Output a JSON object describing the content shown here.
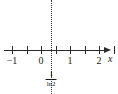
{
  "chart_data": {
    "type": "line",
    "title": "",
    "subtitle": "",
    "xlabel": "x",
    "ylabel": "",
    "xlim": [
      -1.55,
      2.65
    ],
    "ylim": [
      -1,
      1
    ],
    "grid": false,
    "legend": null,
    "axis": {
      "name": "x",
      "arrow": "right",
      "tick_interval": 0.5,
      "minor_ticks": [
        -1.5,
        -1,
        -0.5,
        0,
        0.5,
        1,
        1.5,
        2,
        2.5
      ],
      "labeled_ticks": [
        {
          "value": -1,
          "label": "−1"
        },
        {
          "value": 0,
          "label": "0"
        },
        {
          "value": 1,
          "label": "1"
        },
        {
          "value": 2,
          "label": "2"
        }
      ]
    },
    "annotations": [
      {
        "kind": "vertical-dotted-line",
        "x": 0.35,
        "style": "dotted",
        "color": "#3a3a3a",
        "label_numerator": "1",
        "label_denominator": "ln2",
        "label_text": "1/ln2",
        "label_position": "below-axis"
      }
    ],
    "series": []
  },
  "figure": {
    "background_color": "#ffffff",
    "axis_color": "#2b2b2b",
    "dotted_line_color": "#3a3a3a",
    "text_color": "#1a1a1a",
    "axis_name": "x",
    "tick_labels": {
      "neg_one": "−1",
      "zero": "0",
      "one": "1",
      "two": "2"
    },
    "asymptote_label": {
      "numerator": "1",
      "denominator": "ln2"
    }
  }
}
